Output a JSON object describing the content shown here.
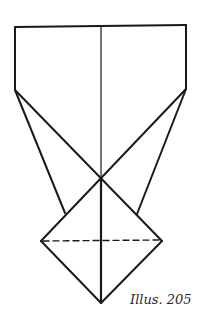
{
  "diagram": {
    "type": "origami-fold-diagram",
    "caption": "Illus. 205",
    "stroke_color": "#1a1a1a",
    "background": "#ffffff",
    "vertices": {
      "top_left": [
        15,
        27
      ],
      "top_right": [
        186,
        25
      ],
      "shoulder_left": [
        15,
        90
      ],
      "shoulder_right": [
        186,
        89
      ],
      "center_top": [
        101,
        26
      ],
      "crossing": [
        101,
        178
      ],
      "diamond_left": [
        41,
        241
      ],
      "diamond_right": [
        162,
        241
      ],
      "diamond_bottom": [
        101,
        303
      ],
      "left_outer_end": [
        65,
        213
      ],
      "right_outer_end": [
        137,
        214
      ]
    }
  }
}
